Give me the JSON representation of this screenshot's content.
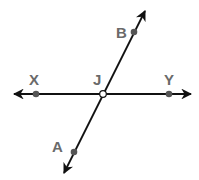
{
  "diagram": {
    "type": "intersecting-lines",
    "colors": {
      "line": "#111111",
      "point": "#555555",
      "label": "#6a6a6a",
      "background": "#ffffff"
    },
    "lines": [
      {
        "name": "line-XY",
        "through": [
          "X",
          "Y"
        ],
        "arrows": "both"
      },
      {
        "name": "line-AB",
        "through": [
          "A",
          "B"
        ],
        "arrows": "both"
      }
    ],
    "points": [
      {
        "label": "X",
        "style": "filled"
      },
      {
        "label": "Y",
        "style": "filled"
      },
      {
        "label": "J",
        "style": "open",
        "note": "intersection"
      },
      {
        "label": "B",
        "style": "filled"
      },
      {
        "label": "A",
        "style": "filled"
      }
    ],
    "labels": {
      "X": "X",
      "Y": "Y",
      "J": "J",
      "B": "B",
      "A": "A"
    }
  }
}
